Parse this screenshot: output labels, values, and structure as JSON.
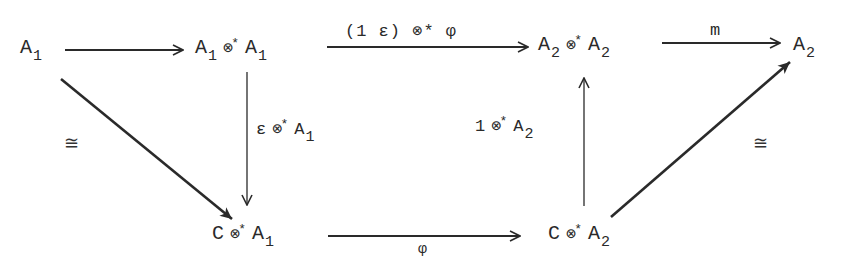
{
  "diagram": {
    "type": "commutative-diagram",
    "nodes": {
      "top_left": {
        "base": "A",
        "sub": "1"
      },
      "top_mid_left": {
        "left_base": "A",
        "left_sub": "1",
        "op": "⊗",
        "op_sup": "*",
        "right_base": "A",
        "right_sub": "1"
      },
      "top_mid_right": {
        "left_base": "A",
        "left_sub": "2",
        "op": "⊗",
        "op_sup": "*",
        "right_base": "A",
        "right_sub": "2"
      },
      "top_right": {
        "base": "A",
        "sub": "2"
      },
      "bottom_left": {
        "left": "C",
        "op": "⊗",
        "op_sup": "*",
        "right_base": "A",
        "right_sub": "1"
      },
      "bottom_right": {
        "left": "C",
        "op": "⊗",
        "op_sup": "*",
        "right_base": "A",
        "right_sub": "2"
      }
    },
    "arrows": {
      "top_left_to_mid": {
        "label": ""
      },
      "top_middle": {
        "label": "(1 ε) ⊗* φ"
      },
      "top_right_m": {
        "label": "m"
      },
      "left_vertical": {
        "label_left": "ε",
        "label_op": "⊗",
        "label_sup": "*",
        "label_base": "A",
        "label_sub": "1"
      },
      "right_vertical": {
        "label_left": "1",
        "label_op": "⊗",
        "label_sup": "*",
        "label_base": "A",
        "label_sub": "2"
      },
      "bottom_phi": {
        "label": "φ"
      },
      "left_diagonal": {
        "label": "≅"
      },
      "right_diagonal": {
        "label": "≅"
      }
    },
    "stroke_color": "#2a2a2a"
  }
}
